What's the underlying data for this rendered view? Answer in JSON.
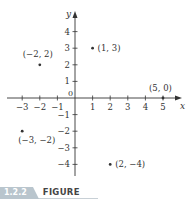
{
  "chart_data": {
    "type": "scatter",
    "title": "",
    "xlabel": "x",
    "ylabel": "y",
    "xlim": [
      -3,
      5
    ],
    "ylim": [
      -4,
      4
    ],
    "grid": false,
    "x_ticks": [
      -3,
      -2,
      -1,
      1,
      2,
      3,
      4,
      5
    ],
    "y_ticks": [
      -4,
      -3,
      -2,
      -1,
      1,
      2,
      3,
      4
    ],
    "origin_label": "0",
    "points": [
      {
        "x": -2,
        "y": 2,
        "label": "(−2, 2)"
      },
      {
        "x": 1,
        "y": 3,
        "label": "(1, 3)"
      },
      {
        "x": 5,
        "y": 0,
        "label": "(5, 0)"
      },
      {
        "x": -3,
        "y": -2,
        "label": "(−3, −2)"
      },
      {
        "x": 2,
        "y": -4,
        "label": "(2, −4)"
      }
    ]
  },
  "figure": {
    "number": "1.2.2",
    "word": "FIGURE"
  },
  "colors": {
    "axis": "#333333",
    "text": "#333333",
    "badge": "#b9c5cd"
  }
}
